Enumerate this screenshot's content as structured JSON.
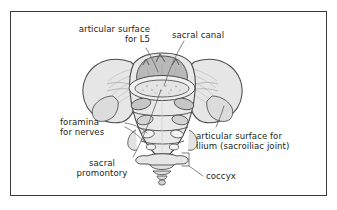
{
  "figure": {
    "frame": {
      "border_color": "#3a3a3c",
      "background_color": "#ffffff"
    },
    "palette": {
      "outline": "#4a4a4c",
      "bone_light": "#e6e6e6",
      "bone_mid": "#d2d2d2",
      "bone_dark": "#b9b9b9",
      "shadow": "#c4c4c4",
      "text": "#231f20",
      "leader_line": "#6b6b6d"
    }
  },
  "labels": [
    {
      "id": "articular-surface-l5",
      "lines": [
        "articular surface",
        "for L5"
      ],
      "align": "right",
      "x": 58,
      "y": 24,
      "width": 92
    },
    {
      "id": "sacral-canal",
      "lines": [
        "sacral canal"
      ],
      "align": "left",
      "x": 172,
      "y": 30,
      "width": 80
    },
    {
      "id": "foramina-for-nerves",
      "lines": [
        "foramina",
        "for nerves"
      ],
      "align": "left",
      "x": 60,
      "y": 117,
      "width": 66
    },
    {
      "id": "articular-surface-ilium",
      "lines": [
        "articular surface for",
        "ilium (sacroiliac joint)"
      ],
      "align": "left",
      "x": 196,
      "y": 131,
      "width": 120
    },
    {
      "id": "sacral-promontory",
      "lines": [
        "sacral",
        "promontory"
      ],
      "align": "center",
      "x": 62,
      "y": 158,
      "width": 80
    },
    {
      "id": "coccyx",
      "lines": [
        "coccyx"
      ],
      "align": "left",
      "x": 206,
      "y": 171,
      "width": 56
    }
  ],
  "anatomy_parts": [
    {
      "id": "sacral-ala-left",
      "name": "left sacral ala"
    },
    {
      "id": "sacral-ala-right",
      "name": "right sacral ala"
    },
    {
      "id": "superior-articular-surface",
      "name": "articular surface for L5"
    },
    {
      "id": "sacral-canal-opening",
      "name": "sacral canal"
    },
    {
      "id": "anterior-sacral-foramina",
      "name": "anterior sacral foramina"
    },
    {
      "id": "transverse-ridges",
      "name": "transverse ridges of fused vertebrae"
    },
    {
      "id": "auricular-surface",
      "name": "articular surface for ilium"
    },
    {
      "id": "sacral-promontory-edge",
      "name": "sacral promontory"
    },
    {
      "id": "coccyx-bone",
      "name": "coccyx"
    }
  ]
}
